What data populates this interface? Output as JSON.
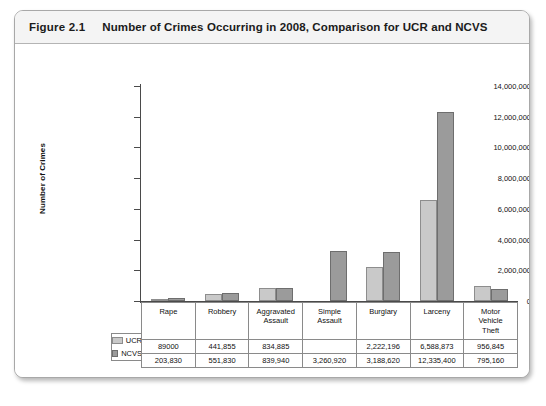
{
  "figure": {
    "number": "Figure 2.1",
    "title": "Number of Crimes Occurring in 2008, Comparison for UCR and NCVS"
  },
  "chart_data": {
    "type": "bar",
    "title": "Number of Crimes Occurring in 2008, Comparison for UCR and NCVS",
    "xlabel": "",
    "ylabel": "Number of Crimes",
    "ylim": [
      0,
      14000000
    ],
    "yticks": [
      0,
      2000000,
      4000000,
      6000000,
      8000000,
      10000000,
      12000000,
      14000000
    ],
    "ytick_labels": [
      "0",
      "2,000,000",
      "4,000,000",
      "6,000,000",
      "8,000,000",
      "10,000,000",
      "12,000,000",
      "14,000,000"
    ],
    "grid": false,
    "legend_position": "table-left",
    "categories": [
      "Rape",
      "Robbery",
      "Aggravated Assault",
      "Simple Assault",
      "Burglary",
      "Larceny",
      "Motor Vehicle Theft"
    ],
    "category_labels": [
      [
        "Rape"
      ],
      [
        "Robbery"
      ],
      [
        "Aggravated",
        "Assault"
      ],
      [
        "Simple",
        "Assault"
      ],
      [
        "Burglary"
      ],
      [
        "Larceny"
      ],
      [
        "Motor",
        "Vehicle",
        "Theft"
      ]
    ],
    "series": [
      {
        "name": "UCR",
        "color": "#c9c9c9",
        "values": [
          89000,
          441855,
          834885,
          null,
          2222196,
          6588873,
          956845
        ],
        "labels": [
          "89000",
          "441,855",
          "834,885",
          "",
          "2,222,196",
          "6,588,873",
          "956,845"
        ]
      },
      {
        "name": "NCVS",
        "color": "#9b9b9b",
        "values": [
          203830,
          551830,
          839940,
          3260920,
          3188620,
          12335400,
          795160
        ],
        "labels": [
          "203,830",
          "551,830",
          "839,940",
          "3,260,920",
          "3,188,620",
          "12,335,400",
          "795,160"
        ]
      }
    ]
  }
}
